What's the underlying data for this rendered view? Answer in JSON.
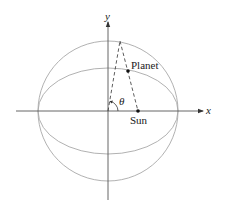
{
  "diagram": {
    "axes": {
      "x_label": "x",
      "y_label": "y"
    },
    "labels": {
      "planet": "Planet",
      "sun": "Sun",
      "angle": "θ"
    },
    "geometry": {
      "origin": [
        108,
        111
      ],
      "circle_radius": 70,
      "ellipse_rx": 70,
      "ellipse_ry": 43,
      "sun": [
        138,
        111
      ],
      "planet": [
        128,
        71
      ],
      "apex": [
        120,
        41
      ]
    },
    "colors": {
      "curve": "#a8a8a8",
      "axis": "#555555",
      "dashed": "#333333",
      "point": "#111111"
    }
  }
}
